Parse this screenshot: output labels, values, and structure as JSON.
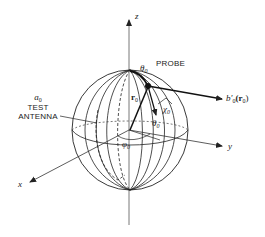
{
  "diagram": {
    "axes": {
      "z": "z",
      "y": "y",
      "x": "x"
    },
    "labels": {
      "probe": "PROBE",
      "test_antenna_symbol": "a",
      "test_antenna_symbol_sub": "0",
      "test_antenna_line1": "TEST",
      "test_antenna_line2": "ANTENNA",
      "theta_top": "θ",
      "theta_top_sub": "0",
      "r_vector": "r",
      "r_vector_sub": "0",
      "chi": "χ",
      "chi_sub": "0",
      "theta_mid": "θ",
      "theta_mid_sub": "0",
      "phi": "φ",
      "phi_sub": "0",
      "output": "b′",
      "output_sub": "0",
      "output_arg": "(r",
      "output_arg_sub": "0",
      "output_close": ")"
    },
    "colors": {
      "line": "#222222",
      "background": "#ffffff"
    }
  }
}
